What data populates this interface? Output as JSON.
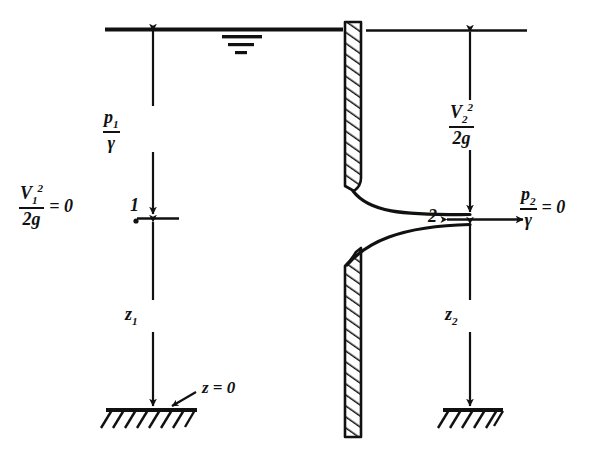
{
  "figure": {
    "colors": {
      "ink": "#111111",
      "background": "#ffffff"
    },
    "labels": {
      "v1_head_numer": "V",
      "v1_head_numer_sup": "2",
      "v1_head_numer_sub": "1",
      "v1_head_denom": "2g",
      "v1_head_equals": "= 0",
      "p1_numer": "p",
      "p1_numer_sub": "1",
      "p1_denom": "γ",
      "z1": "z",
      "z1_sub": "1",
      "point1": "1",
      "datum_callout": "z = 0",
      "v2_head_numer": "V",
      "v2_head_numer_sup": "2",
      "v2_head_numer_sub": "2",
      "v2_head_denom": "2g",
      "p2_numer": "p",
      "p2_numer_sub": "2",
      "p2_denom": "γ",
      "p2_equals": "= 0",
      "z2": "z",
      "z2_sub": "2",
      "point2": "2"
    },
    "elements": {
      "water_surface_line": "free-surface-line",
      "water_surface_symbol": "water-level-symbol",
      "tank_wall": "hatched-tank-wall",
      "nozzle": "converging-nozzle-outlet",
      "left_datum": "left-ground-datum-hatched",
      "right_datum": "right-ground-datum-hatched",
      "egl_right": "right-reference-line"
    }
  }
}
